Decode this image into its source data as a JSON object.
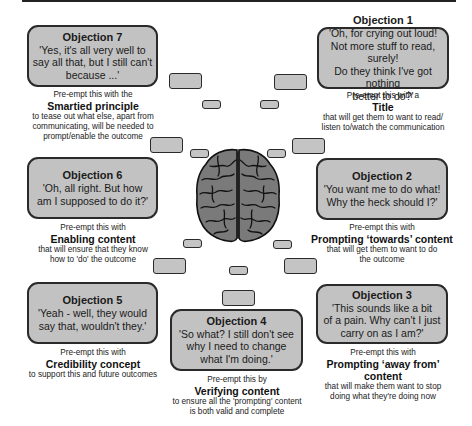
{
  "objections": [
    {
      "id": 7,
      "title": "Objection 7",
      "quote": "'Yes, it's all very well to\nsay all that, but I still can't\nbecause ...'",
      "lead": "Pre-empt this with the",
      "key": "Smartied principle",
      "desc": "to tease out what else, apart from\ncommunicating, will be needed to\nprompt/enable the outcome"
    },
    {
      "id": 1,
      "title": "Objection 1",
      "quote": "'Oh, for crying out loud!\nNot more stuff to read, surely!\nDo they think I've got nothing\nbetter to do?'",
      "lead": "Pre-empt this with a",
      "key": "Title",
      "desc": "that will get them to want to read/\nlisten to/watch the communication"
    },
    {
      "id": 6,
      "title": "Objection 6",
      "quote": "'Oh, all right. But how\nam I supposed to do it?'",
      "lead": "Pre-empt this with",
      "key": "Enabling content",
      "desc": "that will ensure that they know\nhow to 'do' the outcome"
    },
    {
      "id": 2,
      "title": "Objection 2",
      "quote": "'You want me to do what!\nWhy the heck should I?'",
      "lead": "Pre-empt this with",
      "key": "Prompting ‘towards’ content",
      "desc": "that will get them to want to do\nthe outcome"
    },
    {
      "id": 5,
      "title": "Objection 5",
      "quote": "'Yeah - well, they would\nsay that, wouldn't they.'",
      "lead": "Pre-empt this with",
      "key": "Credibility concept",
      "desc": "to support this and future outcomes"
    },
    {
      "id": 4,
      "title": "Objection 4",
      "quote": "'So what? I still don't see\nwhy I need to change\nwhat I'm doing.'",
      "lead": "Pre-empt this by",
      "key": "Verifying content",
      "desc": "to ensure all the 'prompting' content\nis both valid and complete"
    },
    {
      "id": 3,
      "title": "Objection 3",
      "quote": "'This sounds like a bit\nof a pain. Why can't I just\ncarry on as I am?'",
      "lead": "Pre-empt this with",
      "key": "Prompting ‘away from’ content",
      "desc": "that will make them want to stop\ndoing what they're doing now"
    }
  ],
  "center": {
    "icon": "brain-icon"
  },
  "colors": {
    "box_fill": "#c2c2c2",
    "border": "#2a2a2a",
    "brain_fill": "#7a7a7a"
  }
}
